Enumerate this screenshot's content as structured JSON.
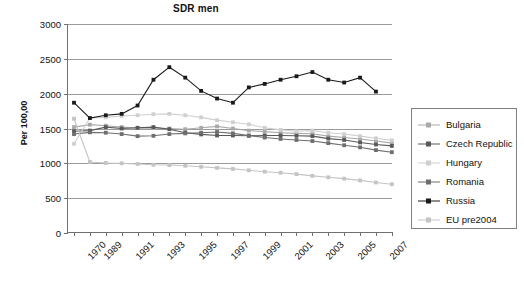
{
  "chart_data": {
    "type": "line",
    "title": "SDR men",
    "xlabel": "",
    "ylabel": "Per 100,00",
    "ylim": [
      0,
      3000
    ],
    "ytick_step": 500,
    "yticks": [
      0,
      500,
      1000,
      1500,
      2000,
      2500,
      3000
    ],
    "grid": true,
    "legend_position": "right",
    "x": [
      1970,
      1989,
      1990,
      1991,
      1992,
      1993,
      1994,
      1995,
      1996,
      1997,
      1998,
      1999,
      2000,
      2001,
      2002,
      2003,
      2004,
      2005,
      2006,
      2007,
      2008
    ],
    "xtick_labels": [
      "1970",
      "1989",
      "",
      "1991",
      "",
      "1993",
      "",
      "1995",
      "",
      "1997",
      "",
      "1999",
      "",
      "2001",
      "",
      "2003",
      "",
      "2005",
      "",
      "2007",
      ""
    ],
    "series": [
      {
        "name": "Bulgaria",
        "color": "#a9a9a9",
        "values": [
          1520,
          1555,
          1540,
          1520,
          1505,
          1505,
          1500,
          1490,
          1510,
          1530,
          1500,
          1470,
          1455,
          1440,
          1430,
          1425,
          1390,
          1370,
          1350,
          1320,
          1290
        ]
      },
      {
        "name": "Czech Republic",
        "color": "#595959",
        "values": [
          1460,
          1470,
          1520,
          1500,
          1510,
          1520,
          1490,
          1440,
          1415,
          1400,
          1400,
          1395,
          1400,
          1400,
          1395,
          1390,
          1355,
          1335,
          1300,
          1270,
          1250
        ]
      },
      {
        "name": "Hungary",
        "color": "#d0d0d0",
        "values": [
          1280,
          1650,
          1660,
          1680,
          1690,
          1705,
          1710,
          1690,
          1660,
          1620,
          1590,
          1560,
          1510,
          1480,
          1460,
          1470,
          1440,
          1420,
          1390,
          1360,
          1330
        ]
      },
      {
        "name": "Romania",
        "color": "#6e6e6e",
        "values": [
          1420,
          1445,
          1440,
          1420,
          1390,
          1395,
          1420,
          1430,
          1440,
          1450,
          1430,
          1400,
          1370,
          1350,
          1335,
          1320,
          1290,
          1260,
          1230,
          1190,
          1160
        ]
      },
      {
        "name": "Russia",
        "color": "#1a1a1a",
        "values": [
          1870,
          1650,
          1690,
          1710,
          1830,
          2200,
          2380,
          2230,
          2040,
          1930,
          1870,
          2090,
          2140,
          2200,
          2250,
          2310,
          2200,
          2160,
          2230,
          2030,
          null
        ]
      },
      {
        "name": "EU pre2004",
        "color": "#c4c4c4",
        "values": [
          1640,
          1020,
          1005,
          1000,
          990,
          980,
          975,
          965,
          950,
          935,
          920,
          900,
          880,
          865,
          845,
          820,
          800,
          780,
          755,
          725,
          700
        ]
      }
    ]
  },
  "legend": {
    "items": [
      {
        "label": "Bulgaria"
      },
      {
        "label": "Czech Republic"
      },
      {
        "label": "Hungary"
      },
      {
        "label": "Romania"
      },
      {
        "label": "Russia"
      },
      {
        "label": "EU pre2004"
      }
    ]
  }
}
